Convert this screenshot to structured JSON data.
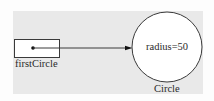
{
  "diagram": {
    "type": "object-reference",
    "variable": {
      "name": "firstCircle"
    },
    "object": {
      "class_name": "Circle",
      "field": "radius=50"
    },
    "colors": {
      "panel": "#e9e9e9",
      "object_fill": "#ffffff",
      "stroke": "#3a3a3a"
    }
  }
}
